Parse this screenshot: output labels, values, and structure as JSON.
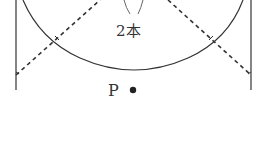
{
  "diagram": {
    "labels": {
      "count": "2本",
      "point": "P"
    },
    "colors": {
      "stroke": "#333333",
      "thin_stroke": "#555555",
      "background": "#ffffff"
    }
  }
}
